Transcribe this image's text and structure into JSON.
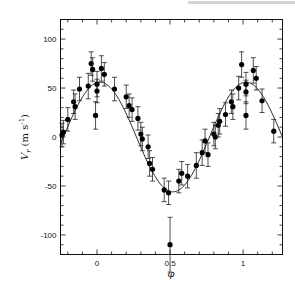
{
  "chart_data": {
    "type": "scatter",
    "title": "",
    "xlabel": "φ",
    "ylabel": "V_r (m s^-1)",
    "ylabel_main": "V",
    "ylabel_sub": "r",
    "ylabel_units": "(m s",
    "ylabel_units_sup": "-1",
    "ylabel_units_close": ")",
    "xlim": [
      -0.25,
      1.27
    ],
    "ylim": [
      -120,
      120
    ],
    "xticks": [
      0,
      0.5,
      1
    ],
    "xtick_labels": [
      "0",
      "0.5",
      "1"
    ],
    "yticks": [
      100,
      50,
      0,
      -50,
      -100
    ],
    "ytick_labels": [
      "100",
      "50",
      "0",
      "-50",
      "-100"
    ],
    "grid": false,
    "legend": null,
    "series": [
      {
        "name": "observations",
        "marker": "filled-circle",
        "error_bars": true,
        "points": [
          {
            "x": -0.24,
            "y": 2,
            "err": 12
          },
          {
            "x": -0.23,
            "y": 5,
            "err": 12
          },
          {
            "x": -0.2,
            "y": 18,
            "err": 12
          },
          {
            "x": -0.16,
            "y": 36,
            "err": 12
          },
          {
            "x": -0.15,
            "y": 31,
            "err": 13
          },
          {
            "x": -0.12,
            "y": 49,
            "err": 12
          },
          {
            "x": -0.06,
            "y": 52,
            "err": 13
          },
          {
            "x": -0.04,
            "y": 75,
            "err": 12
          },
          {
            "x": -0.03,
            "y": 69,
            "err": 12
          },
          {
            "x": 0.0,
            "y": 54,
            "err": 13
          },
          {
            "x": 0.0,
            "y": 47,
            "err": 12
          },
          {
            "x": -0.01,
            "y": 22,
            "err": 14
          },
          {
            "x": 0.03,
            "y": 70,
            "err": 13
          },
          {
            "x": 0.05,
            "y": 64,
            "err": 12
          },
          {
            "x": 0.12,
            "y": 49,
            "err": 12
          },
          {
            "x": 0.2,
            "y": 41,
            "err": 12
          },
          {
            "x": 0.22,
            "y": 32,
            "err": 12
          },
          {
            "x": 0.24,
            "y": 28,
            "err": 12
          },
          {
            "x": 0.28,
            "y": 19,
            "err": 12
          },
          {
            "x": 0.3,
            "y": 3,
            "err": 12
          },
          {
            "x": 0.31,
            "y": -2,
            "err": 12
          },
          {
            "x": 0.35,
            "y": -10,
            "err": 12
          },
          {
            "x": 0.36,
            "y": -27,
            "err": 13
          },
          {
            "x": 0.38,
            "y": -33,
            "err": 12
          },
          {
            "x": 0.46,
            "y": -54,
            "err": 12
          },
          {
            "x": 0.49,
            "y": -57,
            "err": 12
          },
          {
            "x": 0.5,
            "y": -110,
            "err": 28
          },
          {
            "x": 0.56,
            "y": -45,
            "err": 12
          },
          {
            "x": 0.58,
            "y": -37,
            "err": 12
          },
          {
            "x": 0.62,
            "y": -40,
            "err": 12
          },
          {
            "x": 0.68,
            "y": -29,
            "err": 13
          },
          {
            "x": 0.72,
            "y": -16,
            "err": 13
          },
          {
            "x": 0.74,
            "y": -4,
            "err": 12
          },
          {
            "x": 0.76,
            "y": -18,
            "err": 12
          },
          {
            "x": 0.8,
            "y": 3,
            "err": 12
          },
          {
            "x": 0.81,
            "y": 0,
            "err": 12
          },
          {
            "x": 0.83,
            "y": 12,
            "err": 12
          },
          {
            "x": 0.84,
            "y": 16,
            "err": 13
          },
          {
            "x": 0.88,
            "y": 23,
            "err": 12
          },
          {
            "x": 0.92,
            "y": 36,
            "err": 12
          },
          {
            "x": 0.93,
            "y": 31,
            "err": 13
          },
          {
            "x": 0.97,
            "y": 50,
            "err": 12
          },
          {
            "x": 0.99,
            "y": 74,
            "err": 13
          },
          {
            "x": 1.02,
            "y": 54,
            "err": 12
          },
          {
            "x": 1.02,
            "y": 46,
            "err": 12
          },
          {
            "x": 1.02,
            "y": 22,
            "err": 14
          },
          {
            "x": 1.07,
            "y": 68,
            "err": 13
          },
          {
            "x": 1.09,
            "y": 60,
            "err": 12
          },
          {
            "x": 1.13,
            "y": 37,
            "err": 12
          },
          {
            "x": 1.21,
            "y": 6,
            "err": 12
          }
        ]
      },
      {
        "name": "orbital fit",
        "type": "line",
        "amplitude": 56,
        "offset": 0,
        "phase_of_max": 0.02,
        "description": "sinusoidal Keplerian fit, max ≈ 56 at φ≈0 and 1, min ≈ -56 at φ≈0.5"
      }
    ]
  }
}
